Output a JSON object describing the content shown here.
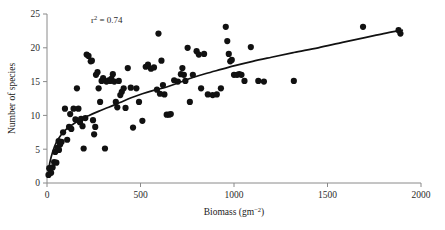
{
  "chart_data": {
    "type": "scatter",
    "title": "",
    "xlabel": "Biomass (gm−2)",
    "xlabel_base": "Biomass (gm",
    "xlabel_sup": "−2",
    "xlabel_tail": ")",
    "ylabel": "Number of species",
    "xlim": [
      0,
      2000
    ],
    "ylim": [
      0,
      25
    ],
    "xticks": [
      0,
      500,
      1000,
      1500,
      2000
    ],
    "yticks": [
      0,
      5,
      10,
      15,
      20,
      25
    ],
    "xtick_labels": [
      "0",
      "500",
      "1000",
      "1500",
      "2000"
    ],
    "ytick_labels": [
      "0",
      "5",
      "10",
      "15",
      "20",
      "25"
    ],
    "grid": false,
    "legend": false,
    "annotations": [
      {
        "text": "r² = 0.74",
        "text_base": "r",
        "text_sup": "2",
        "text_tail": " = 0.74",
        "x": 320,
        "y": 23.6,
        "statistic": "r-squared",
        "value": 0.74
      }
    ],
    "marker": {
      "shape": "circle",
      "color": "#111111",
      "size_px": 6.2,
      "count": 108
    },
    "fit": {
      "kind": "logarithmic-saturating",
      "color": "#111111",
      "width_px": 1.7,
      "description": "smoothed saturating curve rising steeply to ~10 species by 250 gm-2 then gradually to ~22.5 at 1900 gm-2",
      "points": [
        [
          5,
          1.2
        ],
        [
          15,
          3.0
        ],
        [
          30,
          4.6
        ],
        [
          50,
          6.0
        ],
        [
          75,
          7.1
        ],
        [
          105,
          8.0
        ],
        [
          140,
          8.7
        ],
        [
          180,
          9.4
        ],
        [
          225,
          10.0
        ],
        [
          275,
          10.6
        ],
        [
          330,
          11.2
        ],
        [
          390,
          11.9
        ],
        [
          450,
          12.6
        ],
        [
          510,
          13.2
        ],
        [
          570,
          13.7
        ],
        [
          640,
          14.2
        ],
        [
          710,
          14.9
        ],
        [
          780,
          15.6
        ],
        [
          850,
          16.2
        ],
        [
          930,
          16.8
        ],
        [
          1010,
          17.4
        ],
        [
          1100,
          18.0
        ],
        [
          1200,
          18.6
        ],
        [
          1320,
          19.3
        ],
        [
          1450,
          20.0
        ],
        [
          1580,
          20.8
        ],
        [
          1700,
          21.5
        ],
        [
          1800,
          22.1
        ],
        [
          1900,
          22.6
        ]
      ]
    },
    "points": [
      [
        8,
        1.2
      ],
      [
        12,
        2.2
      ],
      [
        18,
        2.1
      ],
      [
        22,
        1.5
      ],
      [
        30,
        2.3
      ],
      [
        38,
        3.1
      ],
      [
        44,
        4.6
      ],
      [
        50,
        3.0
      ],
      [
        56,
        5.2
      ],
      [
        62,
        6.2
      ],
      [
        70,
        5.7
      ],
      [
        86,
        7.5
      ],
      [
        96,
        11.0
      ],
      [
        108,
        6.4
      ],
      [
        118,
        8.3
      ],
      [
        130,
        8.0
      ],
      [
        142,
        11.0
      ],
      [
        152,
        9.4
      ],
      [
        160,
        14.0
      ],
      [
        168,
        11.0
      ],
      [
        176,
        9.0
      ],
      [
        182,
        9.5
      ],
      [
        190,
        8.4
      ],
      [
        196,
        5.1
      ],
      [
        205,
        9.6
      ],
      [
        212,
        19.0
      ],
      [
        222,
        18.8
      ],
      [
        234,
        18.0
      ],
      [
        240,
        18.1
      ],
      [
        246,
        9.3
      ],
      [
        252,
        7.2
      ],
      [
        258,
        8.3
      ],
      [
        262,
        16.0
      ],
      [
        270,
        16.4
      ],
      [
        276,
        14.0
      ],
      [
        284,
        12.0
      ],
      [
        292,
        15.1
      ],
      [
        300,
        15.5
      ],
      [
        310,
        5.1
      ],
      [
        318,
        15.0
      ],
      [
        330,
        15.2
      ],
      [
        338,
        15.1
      ],
      [
        344,
        15.4
      ],
      [
        352,
        16.1
      ],
      [
        360,
        15.0
      ],
      [
        368,
        12.0
      ],
      [
        376,
        11.2
      ],
      [
        384,
        15.1
      ],
      [
        392,
        13.0
      ],
      [
        400,
        13.5
      ],
      [
        410,
        14.0
      ],
      [
        420,
        11.1
      ],
      [
        432,
        17.0
      ],
      [
        448,
        14.1
      ],
      [
        460,
        8.2
      ],
      [
        478,
        14.0
      ],
      [
        492,
        12.0
      ],
      [
        510,
        9.2
      ],
      [
        528,
        17.2
      ],
      [
        540,
        17.5
      ],
      [
        556,
        16.9
      ],
      [
        572,
        17.1
      ],
      [
        588,
        13.8
      ],
      [
        596,
        22.1
      ],
      [
        604,
        13.2
      ],
      [
        612,
        18.1
      ],
      [
        620,
        14.5
      ],
      [
        628,
        13.1
      ],
      [
        640,
        10.1
      ],
      [
        652,
        10.1
      ],
      [
        662,
        10.2
      ],
      [
        680,
        15.2
      ],
      [
        700,
        15.0
      ],
      [
        716,
        16.1
      ],
      [
        724,
        17.0
      ],
      [
        732,
        16.0
      ],
      [
        740,
        15.1
      ],
      [
        752,
        20.0
      ],
      [
        764,
        12.0
      ],
      [
        780,
        16.0
      ],
      [
        800,
        19.5
      ],
      [
        812,
        19.0
      ],
      [
        824,
        14.0
      ],
      [
        840,
        19.1
      ],
      [
        860,
        13.1
      ],
      [
        886,
        13.0
      ],
      [
        908,
        13.1
      ],
      [
        930,
        14.0
      ],
      [
        956,
        23.1
      ],
      [
        964,
        21.0
      ],
      [
        972,
        19.1
      ],
      [
        980,
        18.0
      ],
      [
        988,
        18.2
      ],
      [
        1000,
        16.0
      ],
      [
        1016,
        16.0
      ],
      [
        1028,
        16.1
      ],
      [
        1040,
        16.0
      ],
      [
        1056,
        15.1
      ],
      [
        1090,
        20.1
      ],
      [
        1130,
        15.1
      ],
      [
        1160,
        15.0
      ],
      [
        1320,
        15.1
      ],
      [
        1690,
        23.1
      ],
      [
        1880,
        22.6
      ],
      [
        1890,
        22.1
      ],
      [
        64,
        4.9
      ],
      [
        78,
        6.1
      ],
      [
        124,
        10.2
      ]
    ]
  },
  "figure": {
    "background_color": "#ffffff",
    "axis_color": "#8a8a8a",
    "data_color": "#111111"
  }
}
